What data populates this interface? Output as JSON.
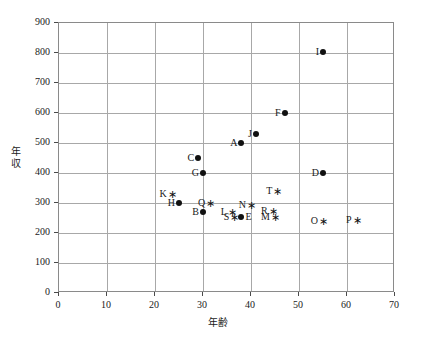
{
  "chart_data": {
    "type": "scatter",
    "title": "",
    "xlabel": "年齢",
    "ylabel": "年収",
    "xlim": [
      0,
      70
    ],
    "ylim": [
      0,
      900
    ],
    "xticks": [
      0,
      10,
      20,
      30,
      40,
      50,
      60,
      70
    ],
    "yticks": [
      0,
      100,
      200,
      300,
      400,
      500,
      600,
      700,
      800,
      900
    ],
    "grid": true,
    "legend": "none",
    "series": [
      {
        "name": "dot-group",
        "marker": "filled-circle",
        "color": "#111111",
        "points": [
          {
            "label": "A",
            "x": 38,
            "y": 500,
            "label_side": "left"
          },
          {
            "label": "B",
            "x": 30,
            "y": 270,
            "label_side": "left"
          },
          {
            "label": "C",
            "x": 29,
            "y": 450,
            "label_side": "left"
          },
          {
            "label": "D",
            "x": 55,
            "y": 400,
            "label_side": "left"
          },
          {
            "label": "E",
            "x": 38,
            "y": 255,
            "label_side": "right"
          },
          {
            "label": "F",
            "x": 47,
            "y": 600,
            "label_side": "left"
          },
          {
            "label": "G",
            "x": 30,
            "y": 400,
            "label_side": "left"
          },
          {
            "label": "H",
            "x": 25,
            "y": 300,
            "label_side": "left"
          },
          {
            "label": "I",
            "x": 55,
            "y": 805,
            "label_side": "left"
          },
          {
            "label": "J",
            "x": 41,
            "y": 530,
            "label_side": "left"
          }
        ]
      },
      {
        "name": "star-group",
        "marker": "asterisk",
        "color": "#111111",
        "points": [
          {
            "label": "K",
            "x": 23.5,
            "y": 330,
            "label_side": "left"
          },
          {
            "label": "L",
            "x": 36,
            "y": 270,
            "label_side": "left"
          },
          {
            "label": "M",
            "x": 45,
            "y": 255,
            "label_side": "left"
          },
          {
            "label": "N",
            "x": 40,
            "y": 295,
            "label_side": "left"
          },
          {
            "label": "O",
            "x": 55,
            "y": 240,
            "label_side": "left"
          },
          {
            "label": "P",
            "x": 62,
            "y": 245,
            "label_side": "left"
          },
          {
            "label": "Q",
            "x": 31.5,
            "y": 300,
            "label_side": "left"
          },
          {
            "label": "R",
            "x": 44.5,
            "y": 275,
            "label_side": "left"
          },
          {
            "label": "S",
            "x": 36.5,
            "y": 252,
            "label_side": "left"
          },
          {
            "label": "T",
            "x": 45.5,
            "y": 340,
            "label_side": "left"
          }
        ]
      }
    ]
  }
}
